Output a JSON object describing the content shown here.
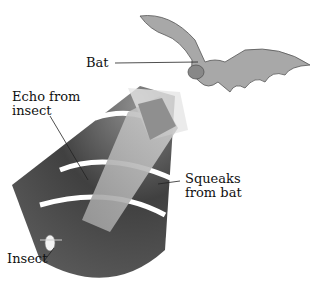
{
  "labels": {
    "bat": "Bat",
    "echo": [
      "Echo from",
      "insect"
    ],
    "squeaks": [
      "Squeaks",
      "from bat"
    ],
    "insect": "Insect"
  },
  "colors": {
    "cone_dark": "#3a3a3a",
    "cone_mid": "#6e6e6e",
    "band_light": "#bdbdbd",
    "wave_white": "#ffffff",
    "bat": "#9a9a9a"
  }
}
